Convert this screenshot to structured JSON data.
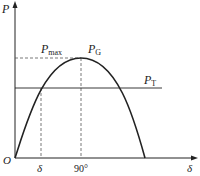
{
  "diagram": {
    "type": "power-angle curve",
    "axes": {
      "y_label": "P",
      "x_label": "δ",
      "origin_label": "O"
    },
    "curve": {
      "shape": "sine half-wave",
      "peak_label_main": "P",
      "peak_label_sub": "G"
    },
    "levels": {
      "pmax_main": "P",
      "pmax_sub": "max",
      "pt_main": "P",
      "pt_sub": "T"
    },
    "x_markers": {
      "delta": "δ",
      "ninety": "90°"
    },
    "colors": {
      "line": "#222222",
      "dashed": "#555555"
    }
  }
}
